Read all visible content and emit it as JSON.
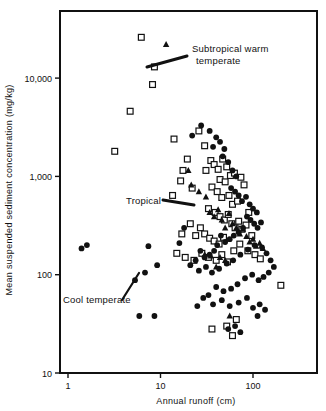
{
  "chart_data": {
    "type": "scatter",
    "title": "",
    "xlabel": "Annual runoff (cm)",
    "ylabel": "Mean suspended sediment concentration (mg/kg)",
    "xscale": "log",
    "yscale": "log",
    "xlim": [
      1,
      300
    ],
    "ylim": [
      10,
      40000
    ],
    "grid": false,
    "legend_position": "inline-annotations",
    "xticks": [
      {
        "value": 1,
        "label": "1"
      },
      {
        "value": 10,
        "label": "10"
      },
      {
        "value": 100,
        "label": "100"
      }
    ],
    "yticks": [
      {
        "value": 10,
        "label": "10"
      },
      {
        "value": 100,
        "label": "100"
      },
      {
        "value": 1000,
        "label": "1,000"
      },
      {
        "value": 10000,
        "label": "10,000"
      }
    ],
    "annotations": [
      {
        "text": "Subtropical warm temperate",
        "marker": "square",
        "tx": 192,
        "ty": 52,
        "lx": 187,
        "ly": 56,
        "ax": 147,
        "ay": 67
      },
      {
        "text": "Tropical",
        "marker": "triangle",
        "tx": 126,
        "ty": 204,
        "lx": 163,
        "ly": 200,
        "ax": 194,
        "ay": 205
      },
      {
        "text": "Cool temperate",
        "marker": "circle",
        "tx": 63,
        "ty": 303,
        "lx": 122,
        "ly": 300,
        "ax": 139,
        "ay": 273
      }
    ],
    "series": [
      {
        "name": "Subtropical warm temperate",
        "marker": "square",
        "color": "#111111",
        "points": [
          [
            6.2,
            26000
          ],
          [
            8.6,
            13000
          ],
          [
            8.2,
            8600
          ],
          [
            4.7,
            4600
          ],
          [
            3.2,
            1800
          ],
          [
            14.0,
            2400
          ],
          [
            17.5,
            1150
          ],
          [
            19.5,
            1500
          ],
          [
            22.0,
            760
          ],
          [
            26.0,
            2900
          ],
          [
            30.0,
            2050
          ],
          [
            35.0,
            1450
          ],
          [
            31.0,
            1150
          ],
          [
            38.0,
            1320
          ],
          [
            42.0,
            1180
          ],
          [
            47.0,
            1500
          ],
          [
            52.0,
            1250
          ],
          [
            44.0,
            930
          ],
          [
            50.0,
            880
          ],
          [
            57.0,
            1020
          ],
          [
            63.0,
            1080
          ],
          [
            36.0,
            780
          ],
          [
            41.0,
            700
          ],
          [
            46.0,
            610
          ],
          [
            55.0,
            640
          ],
          [
            60.0,
            520
          ],
          [
            68.0,
            560
          ],
          [
            74.0,
            980
          ],
          [
            80.0,
            820
          ],
          [
            33.0,
            470
          ],
          [
            39.0,
            430
          ],
          [
            44.0,
            390
          ],
          [
            49.0,
            360
          ],
          [
            54.0,
            410
          ],
          [
            59.0,
            330
          ],
          [
            64.0,
            300
          ],
          [
            70.0,
            350
          ],
          [
            76.0,
            290
          ],
          [
            84.0,
            320
          ],
          [
            90.0,
            430
          ],
          [
            97.0,
            250
          ],
          [
            27.0,
            300
          ],
          [
            30.0,
            260
          ],
          [
            34.0,
            235
          ],
          [
            38.0,
            220
          ],
          [
            43.0,
            205
          ],
          [
            48.0,
            240
          ],
          [
            24.0,
            250
          ],
          [
            21.0,
            330
          ],
          [
            17.0,
            260
          ],
          [
            15.0,
            165
          ],
          [
            18.5,
            150
          ],
          [
            23.0,
            140
          ],
          [
            28.0,
            165
          ],
          [
            33.0,
            150
          ],
          [
            40.0,
            140
          ],
          [
            46.0,
            160
          ],
          [
            53.0,
            135
          ],
          [
            62.0,
            175
          ],
          [
            72.0,
            205
          ],
          [
            88.0,
            175
          ],
          [
            105.0,
            160
          ],
          [
            120.0,
            145
          ],
          [
            200.0,
            78
          ],
          [
            36.0,
            28
          ],
          [
            52.0,
            30
          ],
          [
            60.0,
            24
          ],
          [
            66.0,
            35
          ],
          [
            16.5,
            900
          ],
          [
            13.5,
            640
          ]
        ]
      },
      {
        "name": "Tropical",
        "marker": "triangle",
        "color": "#111111",
        "points": [
          [
            11.5,
            22000
          ],
          [
            20.0,
            1150
          ],
          [
            21.5,
            820
          ],
          [
            26.0,
            700
          ],
          [
            31.0,
            620
          ],
          [
            34.0,
            430
          ],
          [
            38.0,
            390
          ],
          [
            42.0,
            460
          ],
          [
            46.0,
            360
          ],
          [
            50.0,
            300
          ],
          [
            55.0,
            420
          ],
          [
            60.0,
            330
          ],
          [
            66.0,
            300
          ],
          [
            72.0,
            260
          ],
          [
            78.0,
            290
          ],
          [
            85.0,
            245
          ],
          [
            92.0,
            215
          ],
          [
            100.0,
            230
          ],
          [
            108.0,
            195
          ],
          [
            118.0,
            210
          ],
          [
            128.0,
            185
          ],
          [
            30.0,
            160
          ],
          [
            35.0,
            155
          ],
          [
            44.0,
            150
          ],
          [
            50.0,
            140
          ],
          [
            40.0,
            120
          ],
          [
            56.0,
            38
          ]
        ]
      },
      {
        "name": "Cool temperate",
        "marker": "circle",
        "color": "#111111",
        "points": [
          [
            1.4,
            185
          ],
          [
            1.6,
            200
          ],
          [
            5.3,
            88
          ],
          [
            6.8,
            105
          ],
          [
            7.4,
            195
          ],
          [
            9.2,
            125
          ],
          [
            5.9,
            38
          ],
          [
            8.6,
            38
          ],
          [
            22.0,
            2600
          ],
          [
            27.5,
            3300
          ],
          [
            34.0,
            2900
          ],
          [
            40.0,
            2500
          ],
          [
            37.0,
            2000
          ],
          [
            44.0,
            2250
          ],
          [
            49.0,
            1900
          ],
          [
            47.0,
            1600
          ],
          [
            54.0,
            1400
          ],
          [
            60.0,
            1150
          ],
          [
            66.0,
            1000
          ],
          [
            58.0,
            760
          ],
          [
            64.0,
            700
          ],
          [
            70.0,
            640
          ],
          [
            76.0,
            560
          ],
          [
            84.0,
            620
          ],
          [
            92.0,
            520
          ],
          [
            100.0,
            470
          ],
          [
            110.0,
            430
          ],
          [
            86.0,
            390
          ],
          [
            94.0,
            360
          ],
          [
            103.0,
            330
          ],
          [
            112.0,
            300
          ],
          [
            122.0,
            340
          ],
          [
            78.0,
            300
          ],
          [
            70.0,
            270
          ],
          [
            62.0,
            250
          ],
          [
            56.0,
            230
          ],
          [
            50.0,
            215
          ],
          [
            45.0,
            250
          ],
          [
            41.0,
            200
          ],
          [
            38.0,
            175
          ],
          [
            34.0,
            160
          ],
          [
            30.0,
            150
          ],
          [
            27.0,
            175
          ],
          [
            24.0,
            140
          ],
          [
            21.0,
            125
          ],
          [
            26.0,
            110
          ],
          [
            31.0,
            120
          ],
          [
            36.0,
            105
          ],
          [
            43.0,
            115
          ],
          [
            52.0,
            130
          ],
          [
            61.0,
            140
          ],
          [
            73.0,
            160
          ],
          [
            88.0,
            180
          ],
          [
            104.0,
            200
          ],
          [
            125.0,
            190
          ],
          [
            140.0,
            165
          ],
          [
            155.0,
            140
          ],
          [
            168.0,
            120
          ],
          [
            148.0,
            105
          ],
          [
            130.0,
            95
          ],
          [
            115.0,
            88
          ],
          [
            98.0,
            100
          ],
          [
            82.0,
            92
          ],
          [
            68.0,
            80
          ],
          [
            58.0,
            72
          ],
          [
            48.0,
            68
          ],
          [
            40.0,
            75
          ],
          [
            33.0,
            62
          ],
          [
            29.0,
            58
          ],
          [
            37.0,
            50
          ],
          [
            46.0,
            55
          ],
          [
            56.0,
            48
          ],
          [
            70.0,
            52
          ],
          [
            86.0,
            58
          ],
          [
            100.0,
            46
          ],
          [
            118.0,
            50
          ],
          [
            135.0,
            44
          ],
          [
            112.0,
            38
          ],
          [
            64.0,
            30
          ],
          [
            54.0,
            28
          ],
          [
            73.0,
            26
          ],
          [
            25.0,
            48
          ],
          [
            18.0,
            300
          ],
          [
            16.0,
            210
          ]
        ]
      }
    ]
  },
  "axis": {
    "x_title": "Annual runoff (cm)",
    "y_title": "Mean suspended sediment concentration (mg/kg)"
  }
}
